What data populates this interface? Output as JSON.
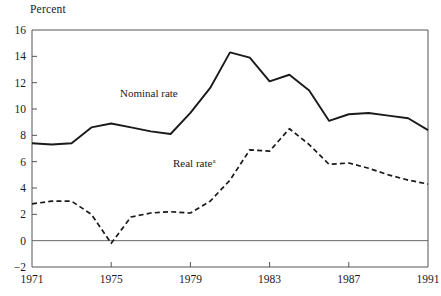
{
  "chart_data": {
    "type": "line",
    "title": "",
    "subtitle": "",
    "xlabel": "",
    "ylabel": "Percent",
    "ylim": [
      -2,
      16
    ],
    "xlim": [
      1971,
      1991
    ],
    "yticks": [
      16,
      14,
      12,
      10,
      8,
      6,
      4,
      2,
      0,
      -2
    ],
    "ytick_labels": [
      "16",
      "14",
      "12",
      "10",
      "8",
      "6",
      "4",
      "2",
      "0",
      "−2"
    ],
    "xticks": [
      1971,
      1975,
      1979,
      1983,
      1987,
      1991
    ],
    "xtick_labels": [
      "1971",
      "1975",
      "1979",
      "1983",
      "1987",
      "1991"
    ],
    "grid": false,
    "zero_line": true,
    "legend_position": "inline-annotations",
    "x": [
      1971,
      1972,
      1973,
      1974,
      1975,
      1976,
      1977,
      1978,
      1979,
      1980,
      1981,
      1982,
      1983,
      1984,
      1985,
      1986,
      1987,
      1988,
      1989,
      1990,
      1991
    ],
    "series": [
      {
        "name": "Nominal rate",
        "style": "solid",
        "color": "#1a1a1a",
        "values": [
          7.4,
          7.3,
          7.4,
          8.6,
          8.9,
          8.6,
          8.3,
          8.1,
          9.7,
          11.6,
          14.3,
          13.9,
          12.1,
          12.6,
          11.4,
          9.1,
          9.6,
          9.7,
          9.5,
          9.3,
          8.4
        ]
      },
      {
        "name": "Real rate",
        "style": "dashed",
        "color": "#1a1a1a",
        "footnote_marker": "a",
        "values": [
          2.8,
          3.0,
          3.0,
          2.0,
          -0.2,
          1.8,
          2.1,
          2.2,
          2.1,
          3.0,
          4.6,
          6.9,
          6.8,
          8.5,
          7.3,
          5.8,
          5.9,
          5.5,
          5.0,
          4.6,
          4.3
        ]
      }
    ],
    "annotations": [
      {
        "text": "Nominal rate",
        "x_px": 120,
        "y_px": 97
      },
      {
        "text": "Real rate",
        "superscript": "a",
        "x_px": 173,
        "y_px": 167
      }
    ]
  },
  "figure": {
    "axis_title": "Percent"
  }
}
